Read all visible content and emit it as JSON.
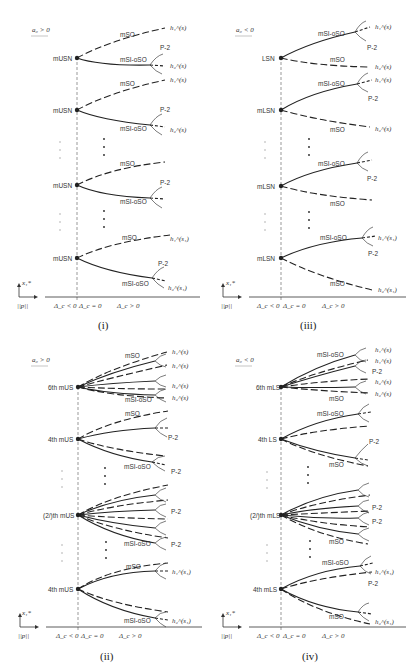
{
  "panels": [
    {
      "id": "i",
      "caption": "(i)",
      "condition": "a₀ > 0",
      "bifurcation_points": [
        "mUSN",
        "mUSN",
        "mUSN",
        "mUSN"
      ],
      "branch_labels": [
        "mSO",
        "mSI-oSO",
        "P-2"
      ],
      "endpoints": [
        "h₁^(s)",
        "h₂^(s)",
        "h₁^(s)",
        "h₂^(s)",
        "h₁^(s₁)",
        "h₂^(s₁)"
      ],
      "axis": {
        "y_label": "x₁*",
        "x_label": "||p||",
        "regions": [
          "Δ_c < 0",
          "Δ_c = 0",
          "Δ_c > 0"
        ]
      }
    },
    {
      "id": "iii",
      "caption": "(iii)",
      "condition": "a₀ < 0",
      "bifurcation_points": [
        "LSN",
        "mLSN",
        "mLSN",
        "mLSN"
      ],
      "branch_labels": [
        "mSI-oSO",
        "mSO",
        "P-2"
      ],
      "endpoints": [
        "h₁^(s)",
        "h₂^(s)",
        "h₁^(s)",
        "h₂^(s)",
        "h₁^(s₁)",
        "h₂^(s₁)"
      ],
      "axis": {
        "y_label": "x₁*",
        "x_label": "||p||",
        "regions": [
          "Δ_c < 0",
          "Δ_c = 0",
          "Δ_c > 0"
        ]
      }
    },
    {
      "id": "ii",
      "caption": "(ii)",
      "condition": "a₀ > 0",
      "bifurcation_points": [
        "6th mUS",
        "4th mUS",
        "(2/)th mUS",
        "4th mUS"
      ],
      "branch_labels": [
        "mSO",
        "mSI-oSO",
        "P-2"
      ],
      "endpoints": [
        "h₁^(s)",
        "h₁^(s)",
        "h₂^(s)",
        "h₂^(s)",
        "h₁^(s₁)",
        "h₂^(s₁)"
      ],
      "axis": {
        "y_label": "x₁*",
        "x_label": "||p||",
        "regions": [
          "Δ_c < 0",
          "Δ_c = 0",
          "Δ_c > 0"
        ]
      }
    },
    {
      "id": "iv",
      "caption": "(iv)",
      "condition": "a₀ < 0",
      "bifurcation_points": [
        "6th mLS",
        "4th LS",
        "(2/)th mLS",
        "4th mLS"
      ],
      "branch_labels": [
        "mSI-oSO",
        "mSO",
        "P-2"
      ],
      "endpoints": [
        "h₁^(s)",
        "h₁^(s)",
        "h₂^(s)",
        "h₂^(s)",
        "h₁^(s₁)",
        "h₂^(s₁)"
      ],
      "axis": {
        "y_label": "x₁*",
        "x_label": "||p||",
        "regions": [
          "Δ_c < 0",
          "Δ_c = 0",
          "Δ_c > 0"
        ]
      }
    }
  ]
}
